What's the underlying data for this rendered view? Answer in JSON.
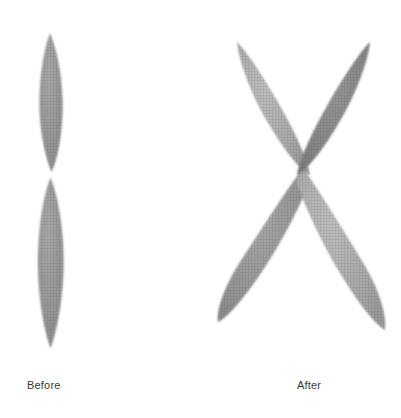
{
  "figure": {
    "background_color": "#ffffff",
    "panels": [
      {
        "id": "before",
        "caption": "Before",
        "shape_name": "chromosome-unreplicated",
        "description": "Single vertical chromosome with two arms meeting at a centromere constriction",
        "arms": [
          {
            "name": "upper-arm",
            "fill": "#9b9b9b",
            "tip_x": 50,
            "tip_y": 33,
            "center_x": 50,
            "center_y": 103,
            "half_length": 70,
            "half_width": 12,
            "angle_deg": 0
          },
          {
            "name": "lower-arm",
            "fill": "#9b9b9b",
            "tip_x": 50,
            "tip_y": 348,
            "center_x": 50,
            "center_y": 262,
            "half_length": 86,
            "half_width": 13,
            "angle_deg": 0
          }
        ],
        "centromere": {
          "x": 50,
          "y": 175
        }
      },
      {
        "id": "after",
        "caption": "After",
        "shape_name": "chromosome-replicated-x",
        "description": "X-shaped chromosome: two sister chromatids crossing at a single centromere, four arms total",
        "arms": [
          {
            "name": "upper-left-arm",
            "fill": "#b2b2b2",
            "tip_x": 237,
            "tip_y": 42,
            "center_x": 270,
            "center_y": 106,
            "half_length": 74,
            "half_width": 13,
            "angle_deg": 27
          },
          {
            "name": "upper-right-arm",
            "fill": "#8b8b8b",
            "tip_x": 370,
            "tip_y": 42,
            "center_x": 337,
            "center_y": 106,
            "half_length": 74,
            "half_width": 13,
            "angle_deg": -27
          },
          {
            "name": "lower-left-arm",
            "fill": "#9e9e9e",
            "tip_x": 218,
            "tip_y": 322,
            "center_x": 260,
            "center_y": 246,
            "half_length": 88,
            "half_width": 14,
            "angle_deg": -29
          },
          {
            "name": "lower-right-arm",
            "fill": "#a8a8a8",
            "tip_x": 385,
            "tip_y": 330,
            "center_x": 344,
            "center_y": 250,
            "half_length": 90,
            "half_width": 14,
            "angle_deg": 29
          }
        ],
        "centromere": {
          "x": 303,
          "y": 170
        }
      }
    ]
  },
  "captions": {
    "before": "Before",
    "after": "After"
  },
  "colors": {
    "background": "#ffffff",
    "caption_text": "#3b3b3b",
    "arm_light": "#b2b2b2",
    "arm_mid": "#9b9b9b",
    "arm_dark": "#8b8b8b"
  }
}
